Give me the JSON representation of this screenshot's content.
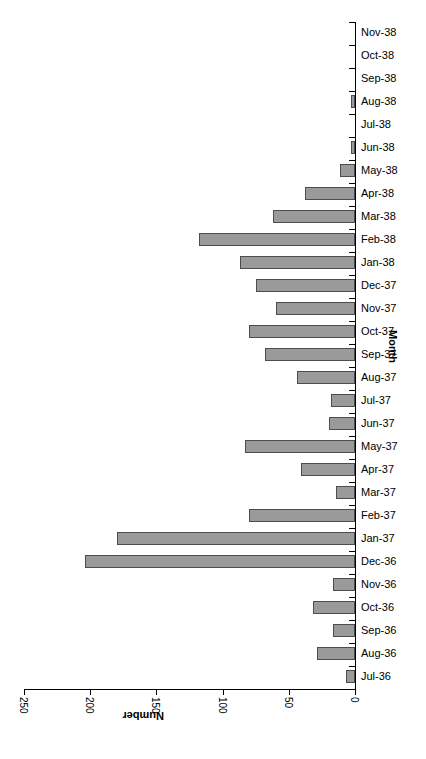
{
  "chart_data": {
    "type": "bar",
    "orientation": "horizontal",
    "title": "",
    "xlabel": "Number",
    "ylabel": "Month",
    "xlim": [
      0,
      250
    ],
    "xticks": [
      250,
      200,
      150,
      100,
      50,
      0
    ],
    "x_axis_reversed": true,
    "x_tick_label_rotation": 90,
    "x_axis_title_rotation": 180,
    "y_axis_title_rotation": 90,
    "grid": false,
    "legend": null,
    "bar_fill_color": "#9a9a9a",
    "bar_border_color": "#4d4d4d",
    "axis_color": "#000000",
    "background_color": "#ffffff",
    "categories": [
      "Nov-38",
      "Oct-38",
      "Sep-38",
      "Aug-38",
      "Jul-38",
      "Jun-38",
      "May-38",
      "Apr-38",
      "Mar-38",
      "Feb-38",
      "Jan-38",
      "Dec-37",
      "Nov-37",
      "Oct-37",
      "Sep-37",
      "Aug-37",
      "Jul-37",
      "Jun-37",
      "May-37",
      "Apr-37",
      "Mar-37",
      "Feb-37",
      "Jan-37",
      "Dec-36",
      "Nov-36",
      "Oct-36",
      "Sep-36",
      "Aug-36",
      "Jul-36"
    ],
    "values": [
      0,
      0,
      0,
      3,
      0,
      3,
      11,
      38,
      62,
      118,
      87,
      75,
      60,
      80,
      68,
      44,
      18,
      20,
      83,
      41,
      14,
      80,
      180,
      204,
      17,
      32,
      17,
      29,
      7
    ]
  }
}
